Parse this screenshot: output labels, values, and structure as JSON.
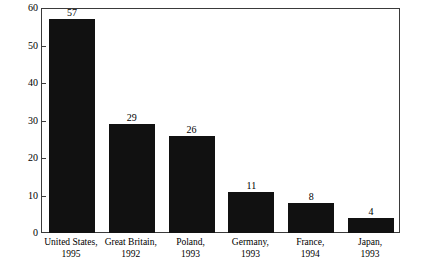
{
  "chart_data": {
    "type": "bar",
    "title": "",
    "subtitle": "",
    "xlabel": "",
    "ylabel": "",
    "ylim": [
      0,
      60
    ],
    "grid": false,
    "legend": "none",
    "y_ticks": [
      0,
      10,
      20,
      30,
      40,
      50,
      60
    ],
    "y_tick_labels": [
      "0",
      "10",
      "20",
      "30",
      "40",
      "50",
      "60"
    ],
    "categories": [
      "United States, 1995",
      "Great Britain, 1992",
      "Poland, 1993",
      "Germany, 1993",
      "France, 1994",
      "Japan, 1993"
    ],
    "category_lines": [
      {
        "line1": "United States,",
        "line2": "1995"
      },
      {
        "line1": "Great Britain,",
        "line2": "1992"
      },
      {
        "line1": "Poland,",
        "line2": "1993"
      },
      {
        "line1": "Germany,",
        "line2": "1993"
      },
      {
        "line1": "France,",
        "line2": "1994"
      },
      {
        "line1": "Japan,",
        "line2": "1993"
      }
    ],
    "values": [
      57,
      29,
      26,
      11,
      8,
      4
    ],
    "value_labels": [
      "57",
      "29",
      "26",
      "11",
      "8",
      "4"
    ],
    "bar_color": "#111111",
    "axis_color": "#3a3a3a",
    "background_color": "#ffffff"
  }
}
